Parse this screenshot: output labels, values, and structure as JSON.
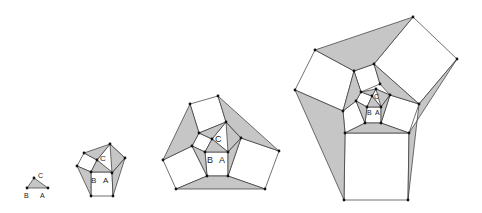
{
  "diagram": {
    "colors": {
      "shade": "#c6c6c6",
      "stroke": "#333333",
      "point": "#111111",
      "background": "#ffffff"
    },
    "labels": {
      "a": "A",
      "b": "B",
      "c": "C"
    },
    "figures": [
      {
        "id": "stage-1",
        "shaded": [
          [
            [
              27,
              188
            ],
            [
              48,
              188
            ],
            [
              34,
              178
            ]
          ]
        ],
        "white": [],
        "points": [
          [
            27,
            188
          ],
          [
            48,
            188
          ],
          [
            34,
            178
          ]
        ],
        "label_size": 7,
        "labels": [
          {
            "key": "c",
            "x": 38,
            "y": 178
          },
          {
            "key": "b",
            "x": 24,
            "y": 198
          },
          {
            "key": "a",
            "x": 40,
            "y": 198
          }
        ]
      },
      {
        "id": "stage-2",
        "shaded": [
          [
            [
              91,
              172
            ],
            [
              112,
              172
            ],
            [
              97,
              160
            ]
          ],
          [
            [
              84,
              153
            ],
            [
              110,
              144
            ],
            [
              97,
              160
            ]
          ],
          [
            [
              110,
              144
            ],
            [
              125,
              158
            ],
            [
              112,
              173
            ]
          ],
          [
            [
              77,
              166
            ],
            [
              91,
              172
            ],
            [
              91,
              196
            ]
          ],
          [
            [
              112,
              173
            ],
            [
              125,
              158
            ],
            [
              113,
              196
            ]
          ]
        ],
        "white": [
          [
            [
              91,
              172
            ],
            [
              112,
              172
            ],
            [
              113,
              196
            ],
            [
              91,
              196
            ]
          ],
          [
            [
              97,
              160
            ],
            [
              110,
              144
            ],
            [
              125,
              158
            ],
            [
              112,
              173
            ]
          ],
          [
            [
              84,
              153
            ],
            [
              97,
              160
            ],
            [
              91,
              172
            ],
            [
              77,
              166
            ]
          ]
        ],
        "points": [
          [
            84,
            153
          ],
          [
            110,
            144
          ],
          [
            125,
            158
          ],
          [
            97,
            160
          ],
          [
            77,
            166
          ],
          [
            91,
            172
          ],
          [
            112,
            173
          ],
          [
            91,
            196
          ],
          [
            113,
            196
          ]
        ],
        "label_size": 8,
        "labels": [
          {
            "key": "c",
            "x": 100,
            "y": 161
          },
          {
            "key": "b",
            "x": 91,
            "y": 183
          },
          {
            "key": "a",
            "x": 103,
            "y": 183
          }
        ]
      },
      {
        "id": "stage-3",
        "shaded": [
          [
            [
              205,
              152
            ],
            [
              228,
              152
            ],
            [
              212,
              139
            ]
          ],
          [
            [
              199,
              133
            ],
            [
              226,
              122
            ],
            [
              212,
              139
            ]
          ],
          [
            [
              226,
              122
            ],
            [
              241,
              138
            ],
            [
              228,
              152
            ]
          ],
          [
            [
              192,
              146
            ],
            [
              205,
              152
            ],
            [
              207,
              176
            ]
          ],
          [
            [
              228,
              152
            ],
            [
              241,
              138
            ],
            [
              228,
              176
            ]
          ],
          [
            [
              190,
              104
            ],
            [
              199,
              133
            ],
            [
              192,
              146
            ],
            [
              163,
              160
            ]
          ],
          [
            [
              218,
              96
            ],
            [
              279,
              151
            ],
            [
              241,
              138
            ],
            [
              226,
              122
            ]
          ],
          [
            [
              176,
              189
            ],
            [
              207,
              176
            ],
            [
              228,
              176
            ],
            [
              265,
              189
            ]
          ]
        ],
        "white": [
          [
            [
              190,
              104
            ],
            [
              218,
              96
            ],
            [
              226,
              122
            ],
            [
              199,
              133
            ]
          ],
          [
            [
              199,
              133
            ],
            [
              212,
              139
            ],
            [
              205,
              152
            ],
            [
              192,
              146
            ]
          ],
          [
            [
              212,
              139
            ],
            [
              226,
              122
            ],
            [
              241,
              138
            ],
            [
              228,
              152
            ]
          ],
          [
            [
              205,
              152
            ],
            [
              228,
              152
            ],
            [
              228,
              176
            ],
            [
              207,
              176
            ]
          ],
          [
            [
              163,
              160
            ],
            [
              192,
              146
            ],
            [
              207,
              176
            ],
            [
              176,
              189
            ]
          ],
          [
            [
              241,
              138
            ],
            [
              279,
              151
            ],
            [
              265,
              189
            ],
            [
              228,
              176
            ]
          ]
        ],
        "points": [
          [
            190,
            104
          ],
          [
            218,
            96
          ],
          [
            199,
            133
          ],
          [
            226,
            122
          ],
          [
            212,
            139
          ],
          [
            241,
            138
          ],
          [
            192,
            146
          ],
          [
            163,
            160
          ],
          [
            205,
            152
          ],
          [
            228,
            152
          ],
          [
            279,
            151
          ],
          [
            207,
            176
          ],
          [
            228,
            176
          ],
          [
            176,
            189
          ],
          [
            265,
            189
          ]
        ],
        "label_size": 9,
        "labels": [
          {
            "key": "c",
            "x": 215,
            "y": 142
          },
          {
            "key": "b",
            "x": 207,
            "y": 163
          },
          {
            "key": "a",
            "x": 219,
            "y": 163
          }
        ]
      },
      {
        "id": "stage-4",
        "shaded": [
          [
            [
              367,
              107
            ],
            [
              381,
              107
            ],
            [
              372,
              96
            ]
          ],
          [
            [
              361,
              92
            ],
            [
              376,
              89
            ],
            [
              372,
              96
            ]
          ],
          [
            [
              376,
              89
            ],
            [
              390,
              95
            ],
            [
              381,
              107
            ]
          ],
          [
            [
              356,
              101
            ],
            [
              367,
              107
            ],
            [
              365,
              123
            ]
          ],
          [
            [
              381,
              107
            ],
            [
              390,
              95
            ],
            [
              381,
              123
            ]
          ],
          [
            [
              354,
              71
            ],
            [
              361,
              92
            ],
            [
              356,
              101
            ],
            [
              343,
              111
            ]
          ],
          [
            [
              374,
              64
            ],
            [
              419,
              104
            ],
            [
              390,
              95
            ],
            [
              380,
              84
            ]
          ],
          [
            [
              345,
              133
            ],
            [
              365,
              123
            ],
            [
              381,
              123
            ],
            [
              409,
              133
            ]
          ],
          [
            [
              315,
              50
            ],
            [
              413,
              17
            ],
            [
              374,
              64
            ],
            [
              354,
              71
            ]
          ],
          [
            [
              457,
              59
            ],
            [
              409,
              133
            ],
            [
              408,
              200
            ],
            [
              419,
              104
            ]
          ],
          [
            [
              295,
              90
            ],
            [
              343,
              111
            ],
            [
              345,
              133
            ],
            [
              344,
              200
            ]
          ]
        ],
        "white": [
          [
            [
              354,
              71
            ],
            [
              374,
              64
            ],
            [
              380,
              84
            ],
            [
              361,
              92
            ]
          ],
          [
            [
              361,
              92
            ],
            [
              372,
              96
            ],
            [
              367,
              107
            ],
            [
              356,
              101
            ]
          ],
          [
            [
              372,
              96
            ],
            [
              376,
              89
            ],
            [
              390,
              95
            ],
            [
              381,
              107
            ]
          ],
          [
            [
              367,
              107
            ],
            [
              381,
              107
            ],
            [
              381,
              123
            ],
            [
              365,
              123
            ]
          ],
          [
            [
              343,
              111
            ],
            [
              356,
              101
            ],
            [
              365,
              123
            ],
            [
              345,
              133
            ]
          ],
          [
            [
              390,
              95
            ],
            [
              419,
              104
            ],
            [
              409,
              133
            ],
            [
              381,
              123
            ]
          ],
          [
            [
              315,
              50
            ],
            [
              354,
              71
            ],
            [
              343,
              111
            ],
            [
              295,
              90
            ]
          ],
          [
            [
              413,
              17
            ],
            [
              457,
              59
            ],
            [
              419,
              104
            ],
            [
              374,
              64
            ]
          ],
          [
            [
              345,
              133
            ],
            [
              409,
              133
            ],
            [
              408,
              200
            ],
            [
              344,
              200
            ]
          ]
        ],
        "points": [
          [
            413,
            17
          ],
          [
            457,
            59
          ],
          [
            315,
            50
          ],
          [
            295,
            90
          ],
          [
            354,
            71
          ],
          [
            374,
            64
          ],
          [
            380,
            84
          ],
          [
            361,
            92
          ],
          [
            376,
            89
          ],
          [
            372,
            96
          ],
          [
            390,
            95
          ],
          [
            356,
            101
          ],
          [
            343,
            111
          ],
          [
            367,
            107
          ],
          [
            381,
            107
          ],
          [
            419,
            104
          ],
          [
            365,
            123
          ],
          [
            381,
            123
          ],
          [
            345,
            133
          ],
          [
            409,
            133
          ],
          [
            344,
            200
          ],
          [
            408,
            200
          ]
        ],
        "label_size": 7,
        "labels": [
          {
            "key": "c",
            "x": 374,
            "y": 99
          },
          {
            "key": "b",
            "x": 367,
            "y": 115
          },
          {
            "key": "a",
            "x": 375,
            "y": 115
          }
        ]
      }
    ]
  }
}
